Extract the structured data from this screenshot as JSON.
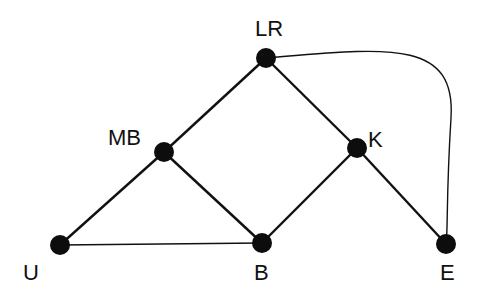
{
  "diagram": {
    "type": "undirected-graph",
    "nodes": [
      {
        "id": "LR",
        "label": "LR",
        "x": 266,
        "y": 58,
        "label_x": 255,
        "label_y": 18
      },
      {
        "id": "MB",
        "label": "MB",
        "x": 164,
        "y": 152,
        "label_x": 108,
        "label_y": 127
      },
      {
        "id": "K",
        "label": "K",
        "x": 357,
        "y": 148,
        "label_x": 368,
        "label_y": 129
      },
      {
        "id": "U",
        "label": "U",
        "x": 60,
        "y": 245,
        "label_x": 23,
        "label_y": 262
      },
      {
        "id": "B",
        "label": "B",
        "x": 262,
        "y": 243,
        "label_x": 254,
        "label_y": 262
      },
      {
        "id": "E",
        "label": "E",
        "x": 446,
        "y": 244,
        "label_x": 440,
        "label_y": 262
      }
    ],
    "edges": [
      {
        "from": "LR",
        "to": "MB"
      },
      {
        "from": "LR",
        "to": "K"
      },
      {
        "from": "MB",
        "to": "U"
      },
      {
        "from": "MB",
        "to": "B"
      },
      {
        "from": "K",
        "to": "B"
      },
      {
        "from": "K",
        "to": "E"
      },
      {
        "from": "U",
        "to": "B",
        "thin": true
      },
      {
        "from": "LR",
        "to": "E",
        "curved": true,
        "thin": true
      }
    ]
  }
}
